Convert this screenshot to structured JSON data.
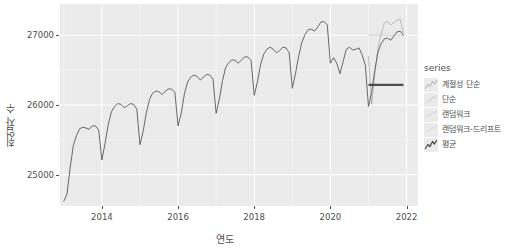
{
  "chart_data": {
    "type": "line",
    "title": "",
    "xlabel": "연도",
    "ylabel": "취업자 수",
    "xlim": [
      2012.9,
      2022.3
    ],
    "ylim": [
      24550,
      27450
    ],
    "grid": true,
    "legend_position": "right",
    "legend_title": "series",
    "x_ticks": [
      "2014",
      "2016",
      "2018",
      "2020",
      "2022"
    ],
    "x_tick_values": [
      2014,
      2016,
      2018,
      2020,
      2022
    ],
    "y_ticks": [
      "25000",
      "26000",
      "27000"
    ],
    "y_tick_values": [
      25000,
      26000,
      27000
    ],
    "series": [
      {
        "name": "계절성 단순",
        "color": "#595959",
        "style": "faint",
        "x": [
          2021.0,
          2021.083,
          2021.167,
          2021.25,
          2021.333,
          2021.417,
          2021.5,
          2021.583,
          2021.667,
          2021.75,
          2021.833,
          2021.917
        ],
        "values": [
          26695,
          26010,
          26450,
          26830,
          27020,
          27180,
          27200,
          27150,
          27180,
          27220,
          27230,
          27030
        ]
      },
      {
        "name": "단순",
        "color": "#7f7f7f",
        "style": "faint",
        "x": [
          2021.0,
          2021.25,
          2021.5,
          2021.75,
          2021.917
        ],
        "values": [
          27000,
          27000,
          27000,
          27000,
          27000
        ]
      },
      {
        "name": "랜덤워크",
        "color": "#9a9a9a",
        "style": "faint",
        "x": [
          2021.0,
          2021.25,
          2021.5,
          2021.75,
          2021.917
        ],
        "values": [
          27000,
          27000,
          27000,
          27000,
          27000
        ]
      },
      {
        "name": "랜덤워크-드리프트",
        "color": "#b0b0b0",
        "style": "faint",
        "x": [
          2021.0,
          2021.25,
          2021.5,
          2021.75,
          2021.917
        ],
        "values": [
          27005,
          27020,
          27035,
          27050,
          27062
        ]
      },
      {
        "name": "평균",
        "color": "#4d4d4d",
        "style": "solid-bold",
        "x": [
          2021.0,
          2021.25,
          2021.5,
          2021.75,
          2021.917
        ],
        "values": [
          26290,
          26290,
          26290,
          26290,
          26290
        ]
      }
    ],
    "observed": {
      "name": "취업자 수 (관측)",
      "color": "#595959",
      "x": [
        2013.0,
        2013.083,
        2013.167,
        2013.25,
        2013.333,
        2013.417,
        2013.5,
        2013.583,
        2013.667,
        2013.75,
        2013.833,
        2013.917,
        2014.0,
        2014.083,
        2014.167,
        2014.25,
        2014.333,
        2014.417,
        2014.5,
        2014.583,
        2014.667,
        2014.75,
        2014.833,
        2014.917,
        2015.0,
        2015.083,
        2015.167,
        2015.25,
        2015.333,
        2015.417,
        2015.5,
        2015.583,
        2015.667,
        2015.75,
        2015.833,
        2015.917,
        2016.0,
        2016.083,
        2016.167,
        2016.25,
        2016.333,
        2016.417,
        2016.5,
        2016.583,
        2016.667,
        2016.75,
        2016.833,
        2016.917,
        2017.0,
        2017.083,
        2017.167,
        2017.25,
        2017.333,
        2017.417,
        2017.5,
        2017.583,
        2017.667,
        2017.75,
        2017.833,
        2017.917,
        2018.0,
        2018.083,
        2018.167,
        2018.25,
        2018.333,
        2018.417,
        2018.5,
        2018.583,
        2018.667,
        2018.75,
        2018.833,
        2018.917,
        2019.0,
        2019.083,
        2019.167,
        2019.25,
        2019.333,
        2019.417,
        2019.5,
        2019.583,
        2019.667,
        2019.75,
        2019.833,
        2019.917,
        2020.0,
        2020.083,
        2020.167,
        2020.25,
        2020.333,
        2020.417,
        2020.5,
        2020.583,
        2020.667,
        2020.75,
        2020.833,
        2020.917,
        2021.0,
        2021.083,
        2021.167,
        2021.25,
        2021.333,
        2021.417,
        2021.5,
        2021.583,
        2021.667,
        2021.75,
        2021.833,
        2021.917
      ],
      "values": [
        24620,
        24720,
        25100,
        25420,
        25560,
        25660,
        25680,
        25670,
        25650,
        25700,
        25700,
        25640,
        25210,
        25450,
        25720,
        25900,
        25980,
        26020,
        26010,
        25960,
        25990,
        26020,
        26010,
        25940,
        25430,
        25620,
        25890,
        26080,
        26170,
        26200,
        26190,
        26150,
        26200,
        26230,
        26230,
        26180,
        25700,
        25880,
        26160,
        26330,
        26400,
        26430,
        26410,
        26360,
        26400,
        26440,
        26430,
        26370,
        25880,
        26080,
        26350,
        26540,
        26610,
        26650,
        26640,
        26600,
        26650,
        26690,
        26690,
        26640,
        26140,
        26330,
        26580,
        26730,
        26800,
        26830,
        26800,
        26750,
        26780,
        26830,
        26820,
        26750,
        26240,
        26450,
        26700,
        26900,
        27010,
        27080,
        27090,
        27060,
        27120,
        27190,
        27200,
        27150,
        26600,
        26680,
        26600,
        26450,
        26620,
        26800,
        26830,
        26790,
        26800,
        26820,
        26720,
        26570,
        25980,
        26180,
        26500,
        26760,
        26880,
        26950,
        26960,
        26930,
        26990,
        27050,
        27060,
        27000
      ]
    }
  }
}
